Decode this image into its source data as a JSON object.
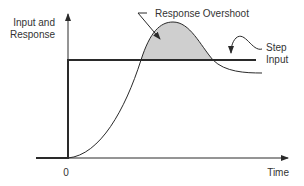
{
  "diagram": {
    "y_axis_label_line1": "Input and",
    "y_axis_label_line2": "Response",
    "x_axis_label": "Time",
    "origin_label": "0",
    "annotations": {
      "overshoot": "Response Overshoot",
      "step_line1": "Step",
      "step_line2": "Input"
    },
    "colors": {
      "line": "#2a2a2a",
      "shade": "#cfcfcf",
      "text": "#333333",
      "background": "#ffffff"
    }
  }
}
